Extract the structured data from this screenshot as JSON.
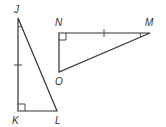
{
  "diagram": {
    "type": "geometry-figure",
    "triangles": [
      {
        "name": "JKL",
        "vertices": {
          "J": {
            "label": "J",
            "x": 18,
            "y": 18
          },
          "K": {
            "label": "K",
            "x": 18,
            "y": 111
          },
          "L": {
            "label": "L",
            "x": 57,
            "y": 111
          }
        },
        "right_angle_at": "K",
        "angle_mark_at": "J",
        "tick_mark_side": "JK"
      },
      {
        "name": "NMO",
        "vertices": {
          "N": {
            "label": "N",
            "x": 59,
            "y": 33
          },
          "M": {
            "label": "M",
            "x": 150,
            "y": 33
          },
          "O": {
            "label": "O",
            "x": 59,
            "y": 72
          }
        },
        "right_angle_at": "N",
        "angle_mark_at": "M",
        "tick_mark_side": "NM"
      }
    ],
    "labels": {
      "J": "J",
      "K": "K",
      "L": "L",
      "N": "N",
      "M": "M",
      "O": "O"
    },
    "colors": {
      "stroke": "#333333",
      "background": "#ffffff"
    }
  }
}
